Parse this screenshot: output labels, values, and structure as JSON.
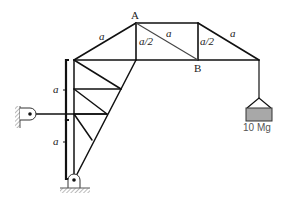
{
  "figure": {
    "type": "truss-diagram",
    "labels": {
      "node_a": "A",
      "node_b": "B",
      "dim_top_left": "a",
      "dim_a_half_left": "a/2",
      "dim_diag_ab": "a",
      "dim_a_half_right": "a/2",
      "dim_top_right": "a",
      "dim_left_upper": "a",
      "dim_left_lower": "a",
      "load": "10 Mg"
    },
    "colors": {
      "member": "#111111",
      "load_block": "#a8a8a8",
      "hatch": "#777777"
    }
  }
}
